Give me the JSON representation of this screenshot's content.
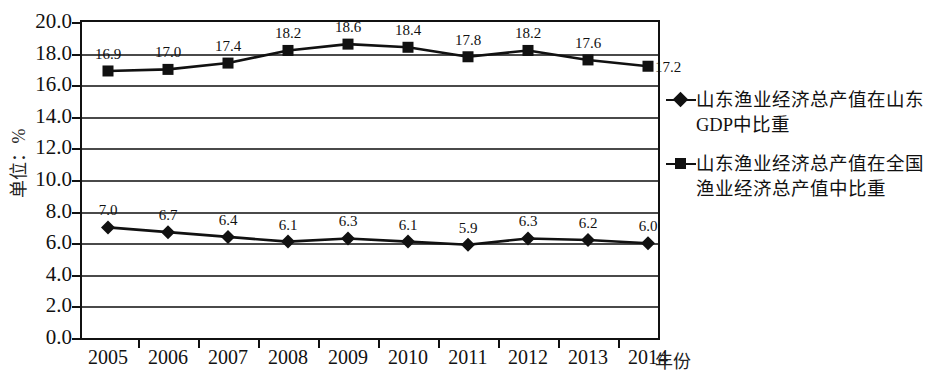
{
  "chart_data": {
    "type": "line",
    "title": "",
    "xlabel": "年份",
    "ylabel": "单位：%",
    "categories": [
      "2005",
      "2006",
      "2007",
      "2008",
      "2009",
      "2010",
      "2011",
      "2012",
      "2013",
      "2014"
    ],
    "ylim": [
      0.0,
      20.0
    ],
    "ytick_labels": [
      "20.0",
      "18.0",
      "16.0",
      "14.0",
      "12.0",
      "10.0",
      "8.0",
      "6.0",
      "4.0",
      "2.0",
      "0.0"
    ],
    "ytick_values": [
      20.0,
      18.0,
      16.0,
      14.0,
      12.0,
      10.0,
      8.0,
      6.0,
      4.0,
      2.0,
      0.0
    ],
    "grid": true,
    "legend_position": "right",
    "series": [
      {
        "name": "山东渔业经济总产值在山东GDP中比重",
        "marker": "diamond",
        "color": "#111111",
        "values": [
          7.0,
          6.7,
          6.4,
          6.1,
          6.3,
          6.1,
          5.9,
          6.3,
          6.2,
          6.0
        ],
        "labels": [
          "7.0",
          "6.7",
          "6.4",
          "6.1",
          "6.3",
          "6.1",
          "5.9",
          "6.3",
          "6.2",
          "6.0"
        ]
      },
      {
        "name": "山东渔业经济总产值在全国渔业经济总产值中比重",
        "marker": "square",
        "color": "#111111",
        "values": [
          16.9,
          17.0,
          17.4,
          18.2,
          18.6,
          18.4,
          17.8,
          18.2,
          17.6,
          17.2
        ],
        "labels": [
          "16.9",
          "17.0",
          "17.4",
          "18.2",
          "18.6",
          "18.4",
          "17.8",
          "18.2",
          "17.6",
          "17.2"
        ]
      }
    ]
  },
  "legend": {
    "entries": [
      {
        "marker": "diamond",
        "line1": "山东渔业经济总产值在山东",
        "line2": "GDP中比重"
      },
      {
        "marker": "square",
        "line1": "山东渔业经济总产值在全国",
        "line2": "渔业经济总产值中比重"
      }
    ]
  },
  "axes": {
    "x_title": "年份",
    "y_title": "单位：%"
  }
}
